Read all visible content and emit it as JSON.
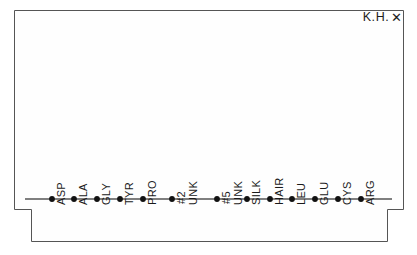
{
  "figure": {
    "corner_annotation": {
      "initials": "K.H.",
      "mark": "✕"
    },
    "background_color": "#ffffff",
    "frame_color": "#555555",
    "axis_color": "#555555",
    "marker_color": "#111111",
    "label_color": "#1a1a1a"
  },
  "chart_data": {
    "type": "scatter",
    "title": "",
    "subtitle": "",
    "xlabel": "",
    "ylabel": "",
    "grid": false,
    "legend": "none",
    "annotations": [
      "K.H. ✕"
    ],
    "note": "Single horizontal baseline with one marker per amino-acid category; all plotted values sit at the baseline (zero).",
    "categories": [
      "ASP",
      "ALA",
      "GLY",
      "TYR",
      "PRO",
      "UNK #2",
      "UNK #5",
      "SILK",
      "HAIR",
      "LEU",
      "GLU",
      "CYS",
      "ARG"
    ],
    "category_lines": [
      [
        "ASP"
      ],
      [
        "ALA"
      ],
      [
        "GLY"
      ],
      [
        "TYR"
      ],
      [
        "PRO"
      ],
      [
        "UNK",
        "#2"
      ],
      [
        "UNK",
        "#5"
      ],
      [
        "SILK"
      ],
      [
        "HAIR"
      ],
      [
        "LEU"
      ],
      [
        "GLU"
      ],
      [
        "CYS"
      ],
      [
        "ARG"
      ]
    ],
    "values": [
      0,
      0,
      0,
      0,
      0,
      0,
      0,
      0,
      0,
      0,
      0,
      0,
      0
    ],
    "x_positions_px": [
      52,
      74,
      97,
      120,
      143,
      172,
      217,
      247,
      270,
      292,
      315,
      338,
      361
    ],
    "ylim": [
      0,
      1
    ],
    "axis_baseline_y_px": 199
  }
}
